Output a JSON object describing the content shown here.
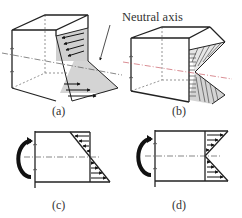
{
  "figure": {
    "annotation": "Neutral axis",
    "panels": [
      {
        "id": "a",
        "label": "(a)",
        "description": "3D beam segment with linear bending stress distribution (compression top, tension bottom)"
      },
      {
        "id": "b",
        "label": "(b)",
        "description": "3D beam segment with reversed-sign stress wedge (V shape)"
      },
      {
        "id": "c",
        "label": "(c)",
        "description": "2D side view with applied moment and linear stress distribution"
      },
      {
        "id": "d",
        "label": "(d)",
        "description": "2D side view with applied moment and V-shaped stress distribution"
      }
    ]
  },
  "colors": {
    "line": "#222222",
    "shade": "#d4d4d4",
    "axis": "#555555",
    "accent": "#c0404a"
  }
}
